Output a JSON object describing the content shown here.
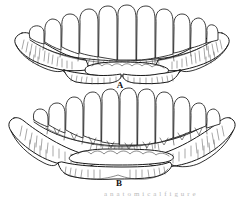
{
  "figure": {
    "background_color": "#ffffff",
    "ink_color": "#1a1a1a",
    "width": 244,
    "height": 198,
    "panels": [
      {
        "id": "A",
        "label": "A",
        "subject": "mandible-with-teeth",
        "view": "superior-occlusal",
        "tooth_count": 15,
        "label_x": 120,
        "label_y": 86
      },
      {
        "id": "B",
        "label": "B",
        "subject": "mandible-with-teeth",
        "view": "superior-occlusal",
        "tooth_count": 16,
        "label_x": 119,
        "label_y": 184
      }
    ],
    "caption_partial": "a n a t o m i c a l   f i g u r e"
  }
}
